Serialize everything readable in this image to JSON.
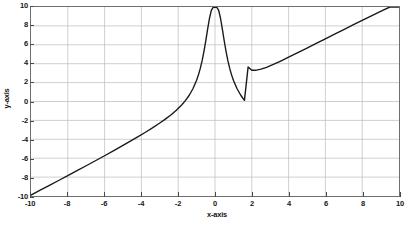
{
  "chart_data": {
    "type": "line",
    "title": "",
    "xlabel": "x-axis",
    "ylabel": "y-axis",
    "xlim": [
      -10,
      10
    ],
    "ylim": [
      -10,
      10
    ],
    "xticks": [
      -10,
      -8,
      -6,
      -4,
      -2,
      0,
      2,
      4,
      6,
      8,
      10
    ],
    "xticklabels": [
      "-10",
      "-8",
      "-6",
      "-4",
      "-2",
      "0",
      "2",
      "4",
      "6",
      "8",
      "10"
    ],
    "yticks": [
      -10,
      -8,
      -6,
      -4,
      -2,
      0,
      2,
      4,
      6,
      8,
      10
    ],
    "yticklabels": [
      "-10",
      "-8",
      "-6",
      "-4",
      "-2",
      "0",
      "2",
      "4",
      "6",
      "8",
      "10"
    ],
    "grid": true,
    "grid_color": "#b9b9b9",
    "legend": null,
    "line_color": "#1a1a1a",
    "line_width": 1.4,
    "series": [
      {
        "name": "curve",
        "x": [
          -10.0,
          -9.5,
          -9.0,
          -8.5,
          -8.0,
          -7.5,
          -7.0,
          -6.5,
          -6.0,
          -5.5,
          -5.0,
          -4.6,
          -4.2,
          -3.8,
          -3.4,
          -3.0,
          -2.7,
          -2.4,
          -2.1,
          -1.8,
          -1.6,
          -1.4,
          -1.2,
          -1.0,
          -0.9,
          -0.8,
          -0.7,
          -0.6,
          -0.5,
          -0.4,
          -0.3,
          -0.2,
          -0.1,
          0.0,
          0.1,
          0.2,
          0.3,
          0.4,
          0.5,
          0.6,
          0.7,
          0.8,
          0.9,
          1.0,
          1.2,
          1.4,
          1.6,
          1.8,
          2.0,
          2.2,
          2.5,
          2.8,
          3.2,
          3.6,
          4.0,
          4.5,
          5.0,
          5.5,
          6.0,
          6.5,
          7.0,
          7.5,
          8.0,
          8.5,
          9.0,
          9.5,
          10.0
        ],
        "y": [
          -9.9,
          -9.39,
          -8.88,
          -8.36,
          -7.84,
          -7.32,
          -6.8,
          -6.27,
          -5.74,
          -5.2,
          -4.65,
          -4.2,
          -3.75,
          -3.28,
          -2.79,
          -2.27,
          -1.87,
          -1.43,
          -0.93,
          -0.34,
          0.12,
          0.66,
          1.35,
          2.25,
          2.82,
          3.5,
          4.32,
          5.3,
          6.43,
          7.66,
          8.81,
          9.65,
          9.96,
          10.0,
          9.96,
          9.65,
          8.81,
          7.66,
          6.43,
          5.3,
          4.32,
          3.5,
          2.82,
          2.25,
          1.35,
          0.66,
          0.12,
          3.66,
          3.3,
          3.3,
          3.42,
          3.62,
          3.95,
          4.31,
          4.69,
          5.17,
          5.65,
          6.14,
          6.63,
          7.12,
          7.61,
          8.1,
          8.58,
          9.07,
          9.55,
          10.0,
          10.4
        ]
      }
    ],
    "annotations": {
      "peak": {
        "x": 0,
        "y": 10
      },
      "local_minimum": {
        "x": 2.1,
        "y": 3.3
      }
    }
  },
  "axes": {
    "x_title": "x-axis",
    "y_title": "y-axis"
  }
}
